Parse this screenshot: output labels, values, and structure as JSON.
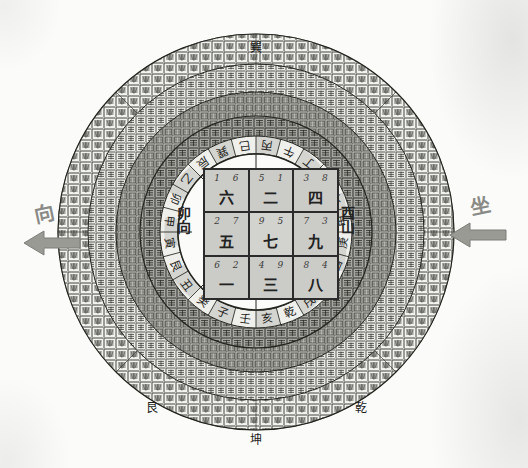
{
  "diagram": {
    "type": "feng-shui-luopan-flying-star",
    "title": "",
    "orientation": {
      "facing_label": "向",
      "sitting_label": "坐",
      "facing_mountain": "卯向",
      "sitting_mountain": "酉山"
    }
  },
  "chart_data": {
    "type": "table",
    "title": "",
    "grid": [
      [
        {
          "stars": "1 6",
          "period": "六",
          "position": "top-left"
        },
        {
          "stars": "5 1",
          "period": "二",
          "position": "top-center"
        },
        {
          "stars": "3 8",
          "period": "四",
          "position": "top-right"
        }
      ],
      [
        {
          "stars": "2 7",
          "period": "五",
          "position": "middle-left"
        },
        {
          "stars": "9 5",
          "period": "七",
          "position": "center"
        },
        {
          "stars": "7 3",
          "period": "九",
          "position": "middle-right"
        }
      ],
      [
        {
          "stars": "6 2",
          "period": "一",
          "position": "bottom-left"
        },
        {
          "stars": "4 9",
          "period": "三",
          "position": "bottom-center"
        },
        {
          "stars": "8 4",
          "period": "八",
          "position": "bottom-right"
        }
      ]
    ]
  },
  "rings": {
    "inner_24_mountains": [
      "壬",
      "子",
      "癸",
      "丑",
      "艮",
      "寅",
      "甲",
      "卯",
      "乙",
      "辰",
      "巽",
      "巳",
      "丙",
      "午",
      "丁",
      "未",
      "坤",
      "申",
      "庚",
      "酉",
      "辛",
      "戌",
      "乾",
      "亥"
    ],
    "outer_ring_note": "dense engraved compass rings",
    "cardinal_marks": [
      "坤",
      "乾",
      "艮",
      "巽"
    ]
  },
  "colors": {
    "paper": "#fbfbfa",
    "ink": "#232323",
    "grid_fill": "#cbcbc7",
    "ring_dark": "#565652",
    "ring_light": "#efefec",
    "arrow": "#8f8f8a"
  }
}
